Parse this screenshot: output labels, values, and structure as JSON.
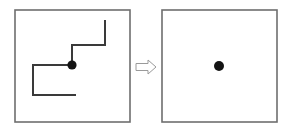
{
  "figure": {
    "title": "Staircase path reduction to a single point",
    "canvas": {
      "width": 285,
      "height": 132,
      "background": "#ffffff"
    },
    "colors": {
      "frame_stroke": "#6e6e6e",
      "path_stroke": "#3a3a3a",
      "dot_fill": "#141414",
      "arrow_stroke": "#9a9a9a",
      "arrow_fill": "#ffffff",
      "background": "#ffffff"
    },
    "panels": [
      {
        "name": "left-panel",
        "label": "input",
        "frame": {
          "x": 15,
          "y": 10,
          "width": 115,
          "height": 112,
          "stroke_width": 1.6
        },
        "point": {
          "x": 72,
          "y": 65,
          "radius": 4.6
        },
        "polyline": {
          "stroke_width": 2.0,
          "points": [
            {
              "x": 105,
              "y": 20
            },
            {
              "x": 105,
              "y": 45
            },
            {
              "x": 72,
              "y": 45
            },
            {
              "x": 72,
              "y": 65
            },
            {
              "x": 33,
              "y": 65
            },
            {
              "x": 33,
              "y": 95
            },
            {
              "x": 76,
              "y": 95
            }
          ]
        }
      },
      {
        "name": "right-panel",
        "label": "output",
        "frame": {
          "x": 162,
          "y": 10,
          "width": 115,
          "height": 112,
          "stroke_width": 1.6
        },
        "point": {
          "x": 219,
          "y": 66,
          "radius": 5.0
        },
        "polyline": {
          "stroke_width": 2.0,
          "points": []
        }
      }
    ],
    "arrow": {
      "name": "transform-arrow",
      "direction": "right",
      "x": 136,
      "y": 60,
      "width": 20,
      "height": 14,
      "stroke_width": 1.0
    }
  }
}
